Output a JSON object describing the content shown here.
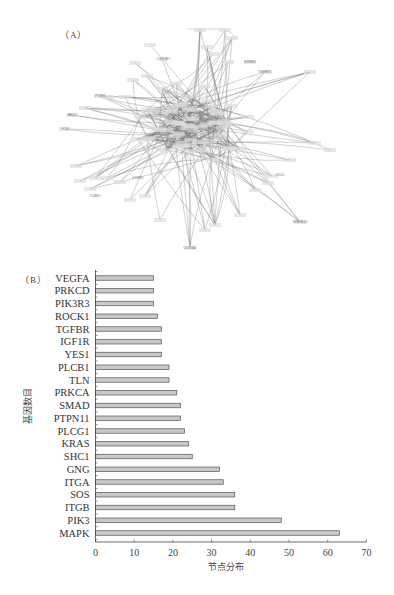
{
  "panels": {
    "a_label": "（A）",
    "b_label": "（B）"
  },
  "network": {
    "description": "Protein-protein interaction network (dense, labels largely illegible at this resolution)",
    "node_labels_legible_approx": [
      "ABL2",
      "FOS",
      "PTEN",
      "VEGFC",
      "SPATA13",
      "COL4A1",
      "TGFBR1",
      "ERBB4",
      "EPBB1",
      "CD40",
      "TUBB1",
      "SRC"
    ]
  },
  "chart_data": {
    "type": "bar",
    "orientation": "horizontal",
    "title": "",
    "xlabel": "节点分布",
    "ylabel": "基因数目",
    "xlim": [
      0,
      70
    ],
    "xticks": [
      0,
      10,
      20,
      30,
      40,
      50,
      60,
      70
    ],
    "grid": false,
    "legend": null,
    "bar_fill": "#c8c8c8",
    "bar_stroke": "#555555",
    "categories": [
      "VEGFA",
      "PRKCD",
      "PIK3R3",
      "ROCK1",
      "TGFBR",
      "IGF1R",
      "YES1",
      "PLCB1",
      "TLN",
      "PRKCA",
      "SMAD",
      "PTPN11",
      "PLCG1",
      "KRAS",
      "SHC1",
      "GNG",
      "ITGA",
      "SOS",
      "ITGB",
      "PIK3",
      "MAPK"
    ],
    "values": [
      15,
      15,
      15,
      16,
      17,
      17,
      17,
      19,
      19,
      21,
      22,
      22,
      23,
      24,
      25,
      32,
      33,
      36,
      36,
      48,
      63
    ]
  }
}
